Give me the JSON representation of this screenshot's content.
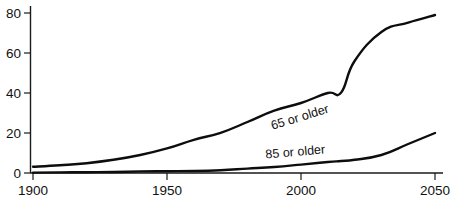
{
  "chart_data": {
    "type": "line",
    "title": "",
    "subtitle": "",
    "xlabel": "",
    "ylabel": "",
    "xlim": [
      1900,
      2050
    ],
    "ylim": [
      0,
      85
    ],
    "grid": false,
    "legend_position": "inline-labels",
    "xticks": [
      {
        "value": 1900,
        "label": "1900"
      },
      {
        "value": 1950,
        "label": "1950"
      },
      {
        "value": 2000,
        "label": "2000"
      },
      {
        "value": 2050,
        "label": "2050"
      }
    ],
    "yticks": [
      {
        "value": 0,
        "label": "0"
      },
      {
        "value": 20,
        "label": "20"
      },
      {
        "value": 40,
        "label": "40"
      },
      {
        "value": 60,
        "label": "60"
      },
      {
        "value": 80,
        "label": "80"
      }
    ],
    "x": [
      1900,
      1910,
      1920,
      1930,
      1940,
      1950,
      1960,
      1970,
      1980,
      1990,
      2000,
      2010,
      2015,
      2020,
      2030,
      2040,
      2050
    ],
    "series": [
      {
        "name": "65 or older",
        "label": "65 or older",
        "color": "#0d0d0d",
        "values": [
          3.1,
          3.9,
          4.9,
          6.6,
          9.0,
          12.3,
          16.6,
          20.1,
          25.5,
          31.2,
          35.0,
          40.0,
          40.3,
          56.0,
          70.5,
          75.2,
          79.0
        ]
      },
      {
        "name": "85 or older",
        "label": "85 or older",
        "color": "#0d0d0d",
        "values": [
          0.2,
          0.3,
          0.4,
          0.5,
          0.8,
          0.9,
          1.0,
          1.4,
          2.2,
          3.0,
          4.2,
          5.5,
          6.0,
          6.6,
          9.0,
          14.5,
          20.0
        ]
      }
    ],
    "annotations": [
      {
        "text": "65 or older",
        "x": 2000,
        "y": 26,
        "rotation": -17
      },
      {
        "text": "85 or older",
        "x": 1998,
        "y": 8.5,
        "rotation": -5
      }
    ]
  }
}
